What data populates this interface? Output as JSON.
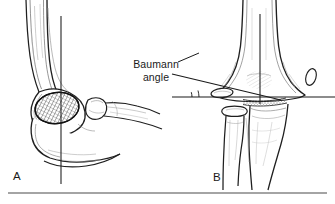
{
  "figure": {
    "kind": "medical-line-illustration",
    "background_color": "#ffffff",
    "ink_color": "#1a1a1a",
    "shading_color": "#6b6b6b"
  },
  "annotations": {
    "baumann_line1": "Baumann",
    "baumann_line2": "angle"
  },
  "panels": [
    {
      "letter": "A",
      "view": "lateral elbow",
      "features": [
        "humeral shaft",
        "capitellum ossification center",
        "olecranon",
        "radial head",
        "proximal radius",
        "proximal ulna",
        "anterior humeral line"
      ]
    },
    {
      "letter": "B",
      "view": "anteroposterior elbow",
      "features": [
        "distal humerus",
        "medial epicondyle",
        "lateral condyle ossification center",
        "radial head",
        "proximal radius",
        "proximal ulna",
        "humeral shaft axis line",
        "horizontal reference line",
        "lateral condyle physeal line",
        "Baumann angle arc"
      ]
    }
  ],
  "panel_letters": {
    "a": "A",
    "b": "B"
  },
  "rule": {
    "present": true,
    "y": 193
  }
}
